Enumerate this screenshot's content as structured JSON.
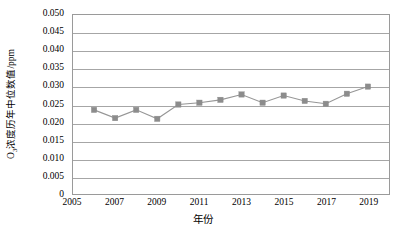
{
  "chart_data": {
    "type": "line",
    "title": "",
    "xlabel": "年份",
    "ylabel": "O3浓度历年中位数值/ppm",
    "ylabel_base": "O",
    "ylabel_sub": "3",
    "ylabel_rest": "浓度历年中位数值/ppm",
    "xlim": [
      2005,
      2020
    ],
    "ylim": [
      0,
      0.05
    ],
    "grid": true,
    "legend": "none",
    "marker": "square",
    "series_color": "#8c8c8c",
    "line_color": "#969696",
    "x": [
      2006,
      2007,
      2008,
      2009,
      2010,
      2011,
      2012,
      2013,
      2014,
      2015,
      2016,
      2017,
      2018,
      2019
    ],
    "values": [
      0.0235,
      0.0212,
      0.0235,
      0.021,
      0.025,
      0.0255,
      0.0263,
      0.0278,
      0.0255,
      0.0275,
      0.026,
      0.0252,
      0.028,
      0.03
    ],
    "y_ticks": [
      0.05,
      0.045,
      0.04,
      0.035,
      0.03,
      0.025,
      0.02,
      0.015,
      0.01,
      0.005,
      0
    ],
    "y_tick_labels": [
      "0.050",
      "0.045",
      "0.040",
      "0.035",
      "0.030",
      "0.025",
      "0.020",
      "0.015",
      "0.010",
      "0.005",
      "0"
    ],
    "x_ticks": [
      2005,
      2007,
      2009,
      2011,
      2013,
      2015,
      2017,
      2019
    ],
    "x_tick_labels": [
      "2005",
      "2007",
      "2009",
      "2011",
      "2013",
      "2015",
      "2017",
      "2019"
    ]
  }
}
